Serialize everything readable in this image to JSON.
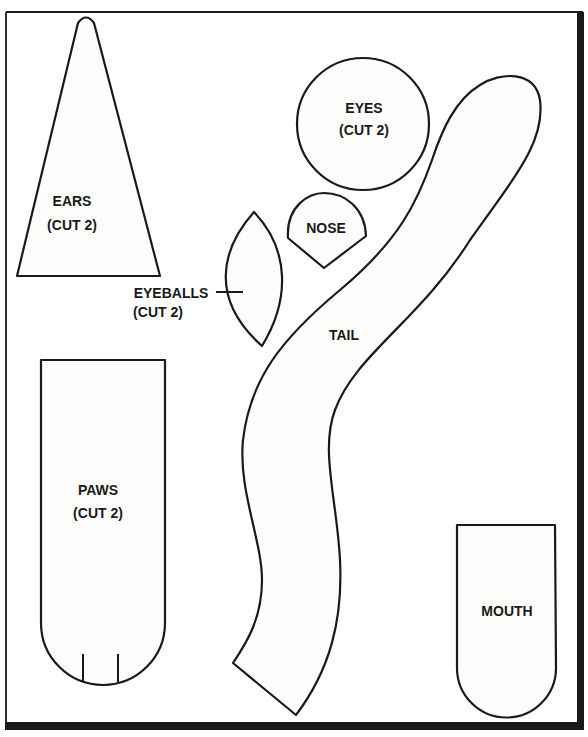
{
  "pattern": {
    "pieces": [
      {
        "name": "ears",
        "label": "EARS",
        "note": "(CUT 2)"
      },
      {
        "name": "eyes",
        "label": "EYES",
        "note": "(CUT 2)"
      },
      {
        "name": "nose",
        "label": "NOSE"
      },
      {
        "name": "eyeballs",
        "label": "EYEBALLS",
        "note": "(CUT 2)"
      },
      {
        "name": "tail",
        "label": "TAIL"
      },
      {
        "name": "paws",
        "label": "PAWS",
        "note": "(CUT 2)"
      },
      {
        "name": "mouth",
        "label": "MOUTH"
      }
    ]
  },
  "colors": {
    "ink": "#1a1a1a",
    "paper": "#fdfdfb"
  }
}
